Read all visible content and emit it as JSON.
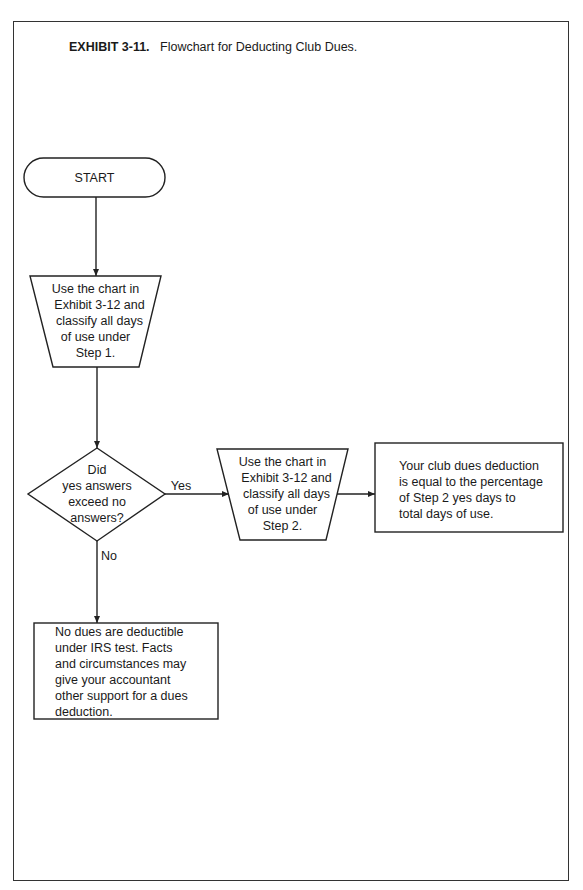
{
  "title": {
    "exhibit": "EXHIBIT 3-11.",
    "caption": "Flowchart for Deducting Club Dues."
  },
  "nodes": {
    "start": {
      "label": "START"
    },
    "step1": {
      "lines": [
        "Use the chart in",
        "Exhibit 3-12 and",
        "classify all days",
        "of use under",
        "Step 1."
      ]
    },
    "decision": {
      "lines": [
        "Did",
        "yes answers",
        "exceed no",
        "answers?"
      ]
    },
    "step2": {
      "lines": [
        "Use the chart in",
        "Exhibit 3-12 and",
        "classify all days",
        "of use under",
        "Step 2."
      ]
    },
    "result_yes": {
      "lines": [
        "Your club dues deduction",
        "is equal to the percentage",
        "of Step 2 yes days to",
        "total days of use."
      ]
    },
    "result_no": {
      "lines": [
        "No dues are deductible",
        "under IRS test. Facts",
        "and circumstances may",
        "give your accountant",
        "other support for a dues",
        "deduction."
      ]
    }
  },
  "edges": {
    "yes_label": "Yes",
    "no_label": "No"
  },
  "colors": {
    "stroke": "#222222",
    "background": "#ffffff"
  }
}
